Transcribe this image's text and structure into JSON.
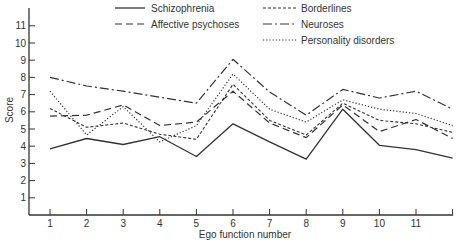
{
  "chart_data": {
    "type": "line",
    "title": "",
    "xlabel": "Ego function number",
    "ylabel": "Score",
    "x": [
      1,
      2,
      3,
      4,
      5,
      6,
      7,
      8,
      9,
      10,
      11,
      12
    ],
    "x_tick_labels": [
      "1",
      "2",
      "3",
      "4",
      "5",
      "6",
      "7",
      "8",
      "9",
      "10",
      "11"
    ],
    "y_tick_labels": [
      "1",
      "2",
      "3",
      "4",
      "5",
      "6",
      "7",
      "8",
      "9",
      "10",
      "11"
    ],
    "ylim": [
      0,
      11.9
    ],
    "xlim": [
      0.3,
      12.3
    ],
    "grid": false,
    "legend_position": "top",
    "series": [
      {
        "name": "Schizophrenia",
        "style": "solid",
        "values": [
          3.85,
          4.45,
          4.1,
          4.55,
          3.4,
          5.3,
          4.25,
          3.25,
          6.15,
          4.05,
          3.8,
          3.3
        ]
      },
      {
        "name": "Affective psychoses",
        "style": "dashed",
        "values": [
          5.75,
          5.8,
          6.4,
          5.2,
          5.4,
          7.2,
          5.35,
          4.5,
          6.4,
          4.85,
          5.55,
          4.45
        ]
      },
      {
        "name": "Borderlines",
        "style": "short-dashed",
        "values": [
          6.2,
          5.1,
          5.35,
          4.7,
          4.4,
          7.6,
          5.5,
          4.65,
          6.5,
          5.5,
          5.3,
          4.8
        ]
      },
      {
        "name": "Neuroses",
        "style": "dash-dot",
        "values": [
          8.0,
          7.5,
          7.2,
          6.85,
          6.5,
          9.05,
          7.15,
          5.8,
          7.3,
          6.8,
          7.2,
          6.15
        ]
      },
      {
        "name": "Personality disorders",
        "style": "dotted",
        "values": [
          7.2,
          4.65,
          6.3,
          4.25,
          5.2,
          8.2,
          6.15,
          5.4,
          6.7,
          6.15,
          5.9,
          5.2
        ]
      }
    ]
  },
  "colors": {
    "line": "#333333",
    "axis": "#333333",
    "background": "#ffffff"
  }
}
